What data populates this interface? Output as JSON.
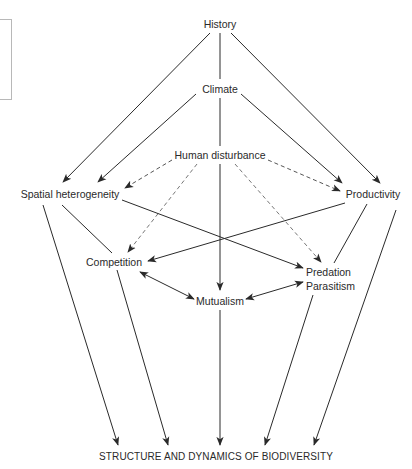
{
  "diagram": {
    "nodes": {
      "history": "History",
      "climate": "Climate",
      "human_disturbance": "Human disturbance",
      "spatial_heterogeneity": "Spatial heterogeneity",
      "productivity": "Productivity",
      "competition": "Competition",
      "predation": "Predation",
      "parasitism": "Parasitism",
      "mutualism": "Mutualism",
      "outcome": "STRUCTURE AND DYNAMICS OF BIODIVERSITY"
    },
    "edges": [
      {
        "from": "History",
        "to": "Spatial heterogeneity",
        "style": "solid",
        "arrow": "end"
      },
      {
        "from": "History",
        "to": "Climate",
        "style": "solid",
        "arrow": "none"
      },
      {
        "from": "History",
        "to": "Productivity",
        "style": "solid",
        "arrow": "end"
      },
      {
        "from": "Climate",
        "to": "Spatial heterogeneity",
        "style": "solid",
        "arrow": "end"
      },
      {
        "from": "Climate",
        "to": "Human disturbance",
        "style": "solid",
        "arrow": "none"
      },
      {
        "from": "Climate",
        "to": "Productivity",
        "style": "solid",
        "arrow": "end"
      },
      {
        "from": "Human disturbance",
        "to": "Spatial heterogeneity",
        "style": "dashed",
        "arrow": "end"
      },
      {
        "from": "Human disturbance",
        "to": "Productivity",
        "style": "dashed",
        "arrow": "end"
      },
      {
        "from": "Human disturbance",
        "to": "Competition",
        "style": "dashed",
        "arrow": "end"
      },
      {
        "from": "Human disturbance",
        "to": "Predation/Parasitism",
        "style": "dashed",
        "arrow": "end"
      },
      {
        "from": "Human disturbance",
        "to": "Mutualism",
        "style": "solid",
        "arrow": "end"
      },
      {
        "from": "Spatial heterogeneity",
        "to": "Predation/Parasitism",
        "style": "solid",
        "arrow": "end"
      },
      {
        "from": "Spatial heterogeneity",
        "to": "Competition",
        "style": "solid",
        "arrow": "none"
      },
      {
        "from": "Spatial heterogeneity",
        "to": "Structure and dynamics of biodiversity",
        "style": "solid",
        "arrow": "end"
      },
      {
        "from": "Productivity",
        "to": "Competition",
        "style": "solid",
        "arrow": "end"
      },
      {
        "from": "Productivity",
        "to": "Predation/Parasitism",
        "style": "solid",
        "arrow": "none"
      },
      {
        "from": "Productivity",
        "to": "Structure and dynamics of biodiversity",
        "style": "solid",
        "arrow": "end"
      },
      {
        "from": "Competition",
        "to": "Mutualism",
        "style": "solid",
        "arrow": "both"
      },
      {
        "from": "Mutualism",
        "to": "Predation/Parasitism",
        "style": "solid",
        "arrow": "both"
      },
      {
        "from": "Competition",
        "to": "Structure and dynamics of biodiversity",
        "style": "solid",
        "arrow": "end"
      },
      {
        "from": "Mutualism",
        "to": "Structure and dynamics of biodiversity",
        "style": "solid",
        "arrow": "end"
      },
      {
        "from": "Predation/Parasitism",
        "to": "Structure and dynamics of biodiversity",
        "style": "solid",
        "arrow": "end"
      }
    ],
    "colors": {
      "line": "#2a2a2a",
      "dashed": "#8a8a8a",
      "text": "#2a2a2a",
      "box": "#b8b8b8"
    }
  }
}
